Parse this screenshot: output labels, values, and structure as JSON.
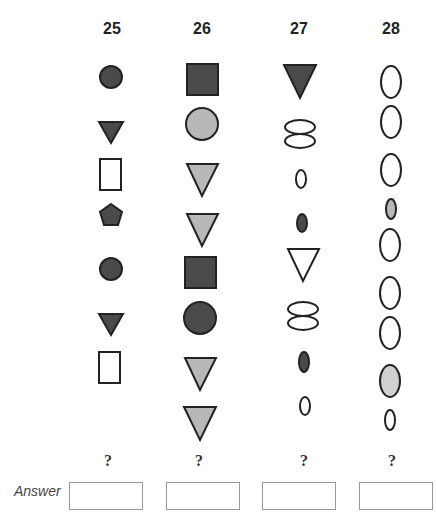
{
  "questions": [
    {
      "number": "25",
      "question_mark": "?",
      "sequence": [
        "dark-circle",
        "dark-triangle-down",
        "white-rectangle",
        "dark-pentagon",
        "dark-circle",
        "dark-triangle-down",
        "white-rectangle"
      ]
    },
    {
      "number": "26",
      "question_mark": "?",
      "sequence": [
        "dark-square",
        "grey-circle",
        "grey-triangle-down",
        "grey-triangle-down",
        "dark-square",
        "dark-circle",
        "grey-triangle-down",
        "grey-triangle-down"
      ]
    },
    {
      "number": "27",
      "question_mark": "?",
      "sequence": [
        "dark-triangle-down",
        "white-double-ellipse",
        "small-white-ellipse",
        "small-dark-ellipse",
        "white-triangle-down",
        "white-double-ellipse",
        "small-dark-ellipse",
        "small-white-ellipse"
      ]
    },
    {
      "number": "28",
      "question_mark": "?",
      "sequence": [
        "white-ellipse",
        "white-ellipse",
        "white-ellipse",
        "small-grey-ellipse",
        "white-ellipse",
        "white-ellipse",
        "white-ellipse",
        "grey-ellipse",
        "small-white-ellipse"
      ]
    }
  ],
  "answer": {
    "label": "Answer"
  },
  "colors": {
    "dark": "#4a4a4a",
    "grey": "#b8b8b8",
    "white": "#ffffff",
    "stroke": "#222222"
  }
}
